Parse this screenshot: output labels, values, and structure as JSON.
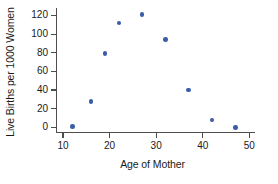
{
  "chart_data": {
    "type": "scatter",
    "title": "",
    "xlabel": "Age of Mother",
    "ylabel": "Live Births per 1000 Women",
    "xlim": [
      8.5,
      51
    ],
    "ylim": [
      -5,
      128
    ],
    "xticks": [
      10,
      20,
      30,
      40,
      50
    ],
    "yticks": [
      0,
      20,
      40,
      60,
      80,
      100,
      120
    ],
    "grid": false,
    "legend": null,
    "marker_color": "#3b5ca8",
    "axis_color": "#4d4d4d",
    "x": [
      12,
      16,
      19,
      22,
      27,
      32,
      37,
      42,
      47
    ],
    "y": [
      1,
      28,
      79,
      112,
      121,
      94,
      40,
      8,
      0
    ],
    "points": [
      {
        "x": 12,
        "y": 1
      },
      {
        "x": 16,
        "y": 28
      },
      {
        "x": 19,
        "y": 79
      },
      {
        "x": 22,
        "y": 112
      },
      {
        "x": 27,
        "y": 121
      },
      {
        "x": 32,
        "y": 94
      },
      {
        "x": 37,
        "y": 40
      },
      {
        "x": 42,
        "y": 8
      },
      {
        "x": 47,
        "y": 0
      }
    ]
  }
}
